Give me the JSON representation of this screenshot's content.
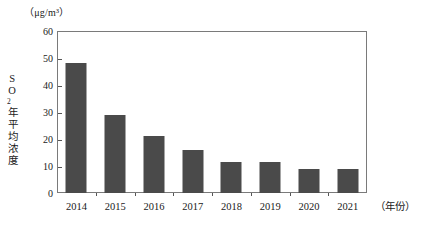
{
  "chart_data": {
    "type": "bar",
    "title": "",
    "subtitle": "",
    "unit_label": "（μg/m³）",
    "xlabel": "（年份）",
    "ylabel": "SO2年平均浓度",
    "ylabel_main": "年平均浓度",
    "ylabel_prefix": "SO",
    "ylabel_subscript": "2",
    "categories": [
      "2014",
      "2015",
      "2016",
      "2017",
      "2018",
      "2019",
      "2020",
      "2021"
    ],
    "values": [
      48,
      29,
      21,
      16,
      11.5,
      11.5,
      9,
      9
    ],
    "ylim": [
      0,
      60
    ],
    "ytick_values": [
      0,
      10,
      20,
      30,
      40,
      50,
      60
    ],
    "ytick_labels": [
      "0",
      "10",
      "20",
      "30",
      "40",
      "50",
      "60"
    ],
    "grid": false,
    "legend": "none",
    "bar_color": "#4a4a4a",
    "frame_color": "#7a7a7a",
    "background_color": "#ffffff"
  }
}
